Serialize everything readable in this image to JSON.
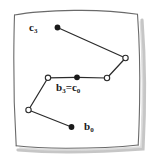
{
  "figure": {
    "kind": "hand-drawn-geometry-diagram",
    "background_color": "#ffffff",
    "paper_color": "#ffffff",
    "ink_color": "#2b2b2b",
    "shadow_color": "#b9b9b9",
    "labels": {
      "start_c": {
        "base": "c",
        "sub": "3",
        "text": "c3",
        "x": 29,
        "y": 22
      },
      "shared": {
        "base_left": "b",
        "sub_left": "3",
        "equals": "=",
        "base_right": "c",
        "sub_right": "0",
        "text": "b3 = c0",
        "x": 56,
        "y": 82
      },
      "start_b": {
        "base": "b",
        "sub": "0",
        "text": "b0",
        "x": 84,
        "y": 121
      }
    },
    "vertices": [
      {
        "name": "c3-endpoint",
        "x": 57,
        "y": 27,
        "style": "filled"
      },
      {
        "name": "c-bend-upper-right",
        "x": 126,
        "y": 58,
        "style": "open"
      },
      {
        "name": "c-bend-lower-right",
        "x": 107,
        "y": 78,
        "style": "open"
      },
      {
        "name": "shared-vertex",
        "x": 77,
        "y": 77,
        "style": "filled"
      },
      {
        "name": "b-bend-left",
        "x": 48,
        "y": 78,
        "style": "open"
      },
      {
        "name": "b-bend-lower-left",
        "x": 28,
        "y": 110,
        "style": "open"
      },
      {
        "name": "b0-endpoint",
        "x": 72,
        "y": 127,
        "style": "filled"
      }
    ],
    "edges": [
      {
        "name": "edge-c3-to-upper-right",
        "from": [
          57,
          27
        ],
        "to": [
          126,
          58
        ]
      },
      {
        "name": "edge-upper-right-to-lower-right",
        "from": [
          126,
          58
        ],
        "to": [
          107,
          78
        ]
      },
      {
        "name": "edge-lower-right-to-shared",
        "from": [
          107,
          78
        ],
        "to": [
          77,
          77
        ]
      },
      {
        "name": "edge-shared-to-left-bend",
        "from": [
          77,
          77
        ],
        "to": [
          48,
          78
        ]
      },
      {
        "name": "edge-left-bend-to-lower-left",
        "from": [
          48,
          78
        ],
        "to": [
          28,
          110
        ]
      },
      {
        "name": "edge-lower-left-to-b0",
        "from": [
          28,
          110
        ],
        "to": [
          72,
          127
        ]
      }
    ],
    "frame": {
      "name": "hand-drawn-card-border",
      "path": "M 14 15 C 48 11, 95 10, 138 14 C 141 54, 141 104, 139 144 C 98 147, 52 148, 16 145 C 13 104, 12 56, 14 15 Z"
    }
  }
}
